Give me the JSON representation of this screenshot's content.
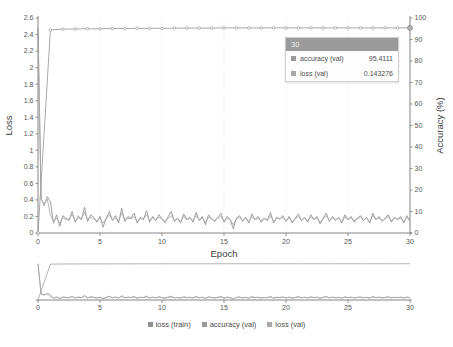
{
  "chart_data": {
    "type": "line",
    "title": "",
    "xlabel": "Epoch",
    "ylabel": "Loss",
    "y2label": "Accuracy (%)",
    "xlim": [
      0,
      30
    ],
    "ylim": [
      0,
      2.6
    ],
    "y2lim": [
      0,
      100
    ],
    "grid": "vertical-dotted",
    "legend_position": "bottom-center",
    "x_ticks": [
      "0",
      "5",
      "10",
      "15",
      "20",
      "25",
      "30"
    ],
    "x_tick_values": [
      0,
      5,
      10,
      15,
      20,
      25,
      30
    ],
    "y_ticks": [
      "0",
      "0.2",
      "0.4",
      "0.6",
      "0.8",
      "1",
      "1.2",
      "1.4",
      "1.6",
      "1.8",
      "2",
      "2.2",
      "2.4",
      "2.6"
    ],
    "y_tick_values": [
      0,
      0.2,
      0.4,
      0.6,
      0.8,
      1,
      1.2,
      1.4,
      1.6,
      1.8,
      2,
      2.2,
      2.4,
      2.6
    ],
    "y2_ticks": [
      "0",
      "10",
      "20",
      "30",
      "40",
      "50",
      "60",
      "70",
      "80",
      "90",
      "100"
    ],
    "y2_tick_values": [
      0,
      10,
      20,
      30,
      40,
      50,
      60,
      70,
      80,
      90,
      100
    ],
    "x": [
      0,
      0.25,
      0.5,
      0.75,
      1,
      1.25,
      1.5,
      1.75,
      2,
      2.25,
      2.5,
      2.75,
      3,
      3.25,
      3.5,
      3.75,
      4,
      4.25,
      4.5,
      4.75,
      5,
      5.25,
      5.5,
      5.75,
      6,
      6.25,
      6.5,
      6.75,
      7,
      7.25,
      7.5,
      7.75,
      8,
      8.25,
      8.5,
      8.75,
      9,
      9.25,
      9.5,
      9.75,
      10,
      10.25,
      10.5,
      10.75,
      11,
      11.25,
      11.5,
      11.75,
      12,
      12.25,
      12.5,
      12.75,
      13,
      13.25,
      13.5,
      13.75,
      14,
      14.25,
      14.5,
      14.75,
      15,
      15.25,
      15.5,
      15.75,
      16,
      16.25,
      16.5,
      16.75,
      17,
      17.25,
      17.5,
      17.75,
      18,
      18.25,
      18.5,
      18.75,
      19,
      19.25,
      19.5,
      19.75,
      20,
      20.25,
      20.5,
      20.75,
      21,
      21.25,
      21.5,
      21.75,
      22,
      22.25,
      22.5,
      22.75,
      23,
      23.25,
      23.5,
      23.75,
      24,
      24.25,
      24.5,
      24.75,
      25,
      25.25,
      25.5,
      25.75,
      26,
      26.25,
      26.5,
      26.75,
      27,
      27.25,
      27.5,
      27.75,
      28,
      28.25,
      28.5,
      28.75,
      29,
      29.25,
      29.5,
      29.75,
      30
    ],
    "series": [
      {
        "name": "loss (train)",
        "axis": "left",
        "color": "#8f8f8f",
        "values": [
          2.48,
          0.42,
          0.33,
          0.44,
          0.38,
          0.12,
          0.22,
          0.08,
          0.21,
          0.18,
          0.15,
          0.26,
          0.13,
          0.21,
          0.16,
          0.31,
          0.14,
          0.22,
          0.19,
          0.13,
          0.2,
          0.07,
          0.18,
          0.26,
          0.15,
          0.21,
          0.12,
          0.3,
          0.14,
          0.2,
          0.18,
          0.24,
          0.12,
          0.19,
          0.16,
          0.27,
          0.13,
          0.2,
          0.15,
          0.22,
          0.17,
          0.12,
          0.2,
          0.26,
          0.14,
          0.18,
          0.12,
          0.23,
          0.16,
          0.19,
          0.13,
          0.25,
          0.15,
          0.2,
          0.1,
          0.22,
          0.17,
          0.14,
          0.19,
          0.24,
          0.13,
          0.2,
          0.16,
          0.05,
          0.18,
          0.21,
          0.14,
          0.19,
          0.12,
          0.23,
          0.16,
          0.2,
          0.13,
          0.18,
          0.15,
          0.25,
          0.12,
          0.19,
          0.17,
          0.21,
          0.14,
          0.2,
          0.12,
          0.18,
          0.23,
          0.15,
          0.19,
          0.13,
          0.22,
          0.16,
          0.2,
          0.11,
          0.18,
          0.24,
          0.14,
          0.2,
          0.15,
          0.19,
          0.12,
          0.22,
          0.16,
          0.2,
          0.13,
          0.18,
          0.21,
          0.15,
          0.19,
          0.12,
          0.24,
          0.16,
          0.2,
          0.14,
          0.18,
          0.22,
          0.13,
          0.19,
          0.16,
          0.2,
          0.12,
          0.21,
          0.143276
        ]
      },
      {
        "name": "loss (val)",
        "axis": "left",
        "color": "#a8a8a8",
        "values": [
          2.48,
          0.4,
          0.36,
          0.41,
          0.22,
          0.14,
          0.18,
          0.12,
          0.19,
          0.16,
          0.17,
          0.22,
          0.15,
          0.18,
          0.17,
          0.25,
          0.16,
          0.19,
          0.17,
          0.15,
          0.18,
          0.12,
          0.17,
          0.22,
          0.16,
          0.18,
          0.15,
          0.24,
          0.16,
          0.18,
          0.17,
          0.2,
          0.14,
          0.18,
          0.17,
          0.22,
          0.15,
          0.18,
          0.16,
          0.19,
          0.17,
          0.14,
          0.18,
          0.21,
          0.15,
          0.17,
          0.14,
          0.2,
          0.16,
          0.18,
          0.15,
          0.21,
          0.16,
          0.18,
          0.13,
          0.19,
          0.17,
          0.15,
          0.18,
          0.2,
          0.14,
          0.18,
          0.16,
          0.1,
          0.17,
          0.19,
          0.15,
          0.18,
          0.14,
          0.2,
          0.16,
          0.18,
          0.15,
          0.17,
          0.16,
          0.21,
          0.14,
          0.18,
          0.17,
          0.19,
          0.15,
          0.18,
          0.14,
          0.17,
          0.2,
          0.16,
          0.18,
          0.15,
          0.19,
          0.17,
          0.18,
          0.13,
          0.17,
          0.21,
          0.15,
          0.18,
          0.16,
          0.18,
          0.14,
          0.19,
          0.17,
          0.18,
          0.15,
          0.17,
          0.19,
          0.16,
          0.18,
          0.14,
          0.21,
          0.17,
          0.18,
          0.15,
          0.17,
          0.2,
          0.15,
          0.18,
          0.17,
          0.18,
          0.14,
          0.19,
          0.143276
        ]
      },
      {
        "name": "accuracy (val)",
        "axis": "right",
        "color": "#9a9a9a",
        "marker": "circle",
        "x": [
          0,
          1,
          2,
          3,
          4,
          5,
          6,
          7,
          8,
          9,
          10,
          11,
          12,
          13,
          14,
          15,
          16,
          17,
          18,
          19,
          20,
          21,
          22,
          23,
          24,
          25,
          26,
          27,
          28,
          29,
          30
        ],
        "values": [
          0,
          94.4,
          94.8,
          94.9,
          95.0,
          95.0,
          95.1,
          95.1,
          95.2,
          95.2,
          95.2,
          95.3,
          95.3,
          95.3,
          95.3,
          95.4,
          95.4,
          95.4,
          95.4,
          95.4,
          95.4,
          95.4,
          95.4,
          95.4,
          95.4,
          95.4,
          95.4,
          95.4,
          95.4,
          95.4,
          95.4111
        ]
      }
    ]
  },
  "tooltip": {
    "header": "30",
    "rows": [
      {
        "label": "accuracy (val)",
        "value": "95.4111",
        "color": "#9a9a9a"
      },
      {
        "label": "loss (val)",
        "value": "0.143276",
        "color": "#a8a8a8"
      }
    ]
  },
  "legend": {
    "items": [
      {
        "label": "loss (train)",
        "color": "#8f8f8f"
      },
      {
        "label": "accuracy (val)",
        "color": "#9a9a9a"
      },
      {
        "label": "loss (val)",
        "color": "#a8a8a8"
      }
    ]
  },
  "overview": {
    "x_ticks": [
      "0",
      "5",
      "10",
      "15",
      "20",
      "25",
      "30"
    ],
    "x_tick_values": [
      0,
      5,
      10,
      15,
      20,
      25,
      30
    ]
  }
}
